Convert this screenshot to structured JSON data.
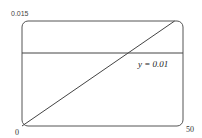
{
  "chart_data": {
    "type": "line",
    "title": "",
    "xlabel": "",
    "ylabel": "",
    "xlim": [
      0,
      50
    ],
    "ylim": [
      0,
      0.015
    ],
    "grid": false,
    "x_tick_labels": [
      "0",
      "50"
    ],
    "y_tick_labels": [
      "0.015"
    ],
    "series": [
      {
        "name": "increasing line",
        "x": [
          0,
          47.4
        ],
        "y": [
          0,
          0.015
        ]
      },
      {
        "name": "y = 0.01",
        "x": [
          0,
          50
        ],
        "y": [
          0.01,
          0.01
        ]
      }
    ],
    "annotations": [
      {
        "text": "y = 0.01",
        "x": 36,
        "y": 0.0092
      }
    ],
    "intersection": {
      "x": 31.6,
      "y": 0.01
    }
  },
  "labels": {
    "y_max": "0.015",
    "x_min": "0",
    "x_max": "50",
    "annotation": "y = 0.01"
  }
}
